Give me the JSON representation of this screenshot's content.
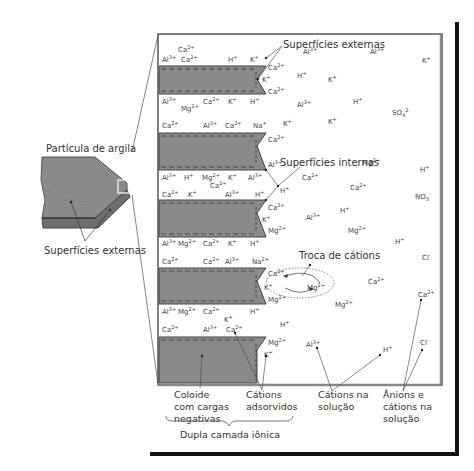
{
  "labels": {
    "particle_title": "Partícula de argila",
    "particle_external": "Superfícies externas",
    "external_surfaces": "Superfícies externas",
    "internal_surfaces": "Superfícies internas",
    "cation_exchange": "Troca de cátions",
    "colloid": [
      "Coloide",
      "com cargas",
      "negativas"
    ],
    "adsorbed_cations": [
      "Cátions",
      "adsorvidos"
    ],
    "solution_cations": [
      "Cátions na",
      "solução"
    ],
    "anions_cations": [
      "Ânions e",
      "cátions na",
      "solução"
    ],
    "double_layer": "Dupla camada iônica"
  },
  "colors": {
    "clay": "#8a8a8a",
    "clay_dark": "#5a5a5a",
    "frame": "#111111",
    "box_border": "#555555",
    "text": "#333333"
  },
  "ions": [
    {
      "x": 178,
      "y": 52,
      "b": "Ca",
      "s": "2+"
    },
    {
      "x": 162,
      "y": 62,
      "b": "Al",
      "s": "3+"
    },
    {
      "x": 181,
      "y": 62,
      "b": "Ca",
      "s": "2+"
    },
    {
      "x": 228,
      "y": 62,
      "b": "H",
      "s": "+"
    },
    {
      "x": 250,
      "y": 62,
      "b": "K",
      "s": "+"
    },
    {
      "x": 268,
      "y": 70,
      "b": "Ca",
      "s": "2+"
    },
    {
      "x": 262,
      "y": 82,
      "b": "K",
      "s": "+"
    },
    {
      "x": 268,
      "y": 94,
      "b": "Ca",
      "s": "2+"
    },
    {
      "x": 303,
      "y": 54,
      "b": "Al",
      "s": "3+"
    },
    {
      "x": 370,
      "y": 54,
      "b": "Al",
      "s": "3+"
    },
    {
      "x": 422,
      "y": 63,
      "b": "K",
      "s": "+"
    },
    {
      "x": 297,
      "y": 78,
      "b": "H",
      "s": "+"
    },
    {
      "x": 328,
      "y": 82,
      "b": "K",
      "s": "+"
    },
    {
      "x": 162,
      "y": 104,
      "b": "Al",
      "s": "3+"
    },
    {
      "x": 181,
      "y": 111,
      "b": "Mg",
      "s": "2+"
    },
    {
      "x": 203,
      "y": 104,
      "b": "Ca",
      "s": "2+"
    },
    {
      "x": 228,
      "y": 104,
      "b": "K",
      "s": "+"
    },
    {
      "x": 250,
      "y": 104,
      "b": "H",
      "s": "+"
    },
    {
      "x": 297,
      "y": 107,
      "b": "Al",
      "s": "3+"
    },
    {
      "x": 353,
      "y": 104,
      "b": "H",
      "s": "+"
    },
    {
      "x": 392,
      "y": 115,
      "b": "SO",
      "sub": "4",
      "s": "2-"
    },
    {
      "x": 328,
      "y": 124,
      "b": "K",
      "s": "+"
    },
    {
      "x": 162,
      "y": 128,
      "b": "Ca",
      "s": "2+"
    },
    {
      "x": 203,
      "y": 128,
      "b": "Al",
      "s": "3+"
    },
    {
      "x": 225,
      "y": 128,
      "b": "Ca",
      "s": "2+"
    },
    {
      "x": 253,
      "y": 128,
      "b": "Na",
      "s": "+"
    },
    {
      "x": 283,
      "y": 126,
      "b": "K",
      "s": "+"
    },
    {
      "x": 268,
      "y": 142,
      "b": "Ca",
      "s": "2+"
    },
    {
      "x": 268,
      "y": 167,
      "b": "Al",
      "s": "3+"
    },
    {
      "x": 302,
      "y": 180,
      "b": "Ca",
      "s": "2+"
    },
    {
      "x": 362,
      "y": 165,
      "b": "Mg",
      "s": "2+"
    },
    {
      "x": 420,
      "y": 172,
      "b": "H",
      "s": "+"
    },
    {
      "x": 162,
      "y": 180,
      "b": "Al",
      "s": "3+"
    },
    {
      "x": 184,
      "y": 180,
      "b": "H",
      "s": "+"
    },
    {
      "x": 202,
      "y": 180,
      "b": "Mg",
      "s": "2+"
    },
    {
      "x": 228,
      "y": 180,
      "b": "K",
      "s": "+"
    },
    {
      "x": 248,
      "y": 180,
      "b": "Al",
      "s": "3+"
    },
    {
      "x": 210,
      "y": 188,
      "b": "Ca",
      "s": "2+"
    },
    {
      "x": 350,
      "y": 190,
      "b": "Ca",
      "s": "2+"
    },
    {
      "x": 415,
      "y": 199,
      "b": "NO",
      "sub": "3",
      "s": "-"
    },
    {
      "x": 162,
      "y": 197,
      "b": "Ca",
      "s": "2+"
    },
    {
      "x": 188,
      "y": 197,
      "b": "K",
      "s": "+"
    },
    {
      "x": 225,
      "y": 197,
      "b": "Al",
      "s": "3+"
    },
    {
      "x": 255,
      "y": 197,
      "b": "H",
      "s": "+"
    },
    {
      "x": 280,
      "y": 193,
      "b": "H",
      "s": "+"
    },
    {
      "x": 268,
      "y": 210,
      "b": "Ca",
      "s": "2+"
    },
    {
      "x": 262,
      "y": 222,
      "b": "K",
      "s": "+"
    },
    {
      "x": 268,
      "y": 233,
      "b": "Mg",
      "s": "2+"
    },
    {
      "x": 306,
      "y": 220,
      "b": "Al",
      "s": "3+"
    },
    {
      "x": 340,
      "y": 213,
      "b": "H",
      "s": "+"
    },
    {
      "x": 348,
      "y": 233,
      "b": "Mg",
      "s": "2+"
    },
    {
      "x": 162,
      "y": 246,
      "b": "Al",
      "s": "3+"
    },
    {
      "x": 178,
      "y": 246,
      "b": "Mg",
      "s": "2+"
    },
    {
      "x": 203,
      "y": 246,
      "b": "Ca",
      "s": "2+"
    },
    {
      "x": 228,
      "y": 246,
      "b": "K",
      "s": "+"
    },
    {
      "x": 250,
      "y": 246,
      "b": "H",
      "s": "+"
    },
    {
      "x": 395,
      "y": 244,
      "b": "H",
      "s": "+"
    },
    {
      "x": 162,
      "y": 264,
      "b": "Ca",
      "s": "2+"
    },
    {
      "x": 203,
      "y": 264,
      "b": "Ca",
      "s": "2+"
    },
    {
      "x": 225,
      "y": 264,
      "b": "Al",
      "s": "3+"
    },
    {
      "x": 252,
      "y": 264,
      "b": "Na",
      "s": "2+"
    },
    {
      "x": 422,
      "y": 260,
      "b": "Cl",
      "s": "-"
    },
    {
      "x": 268,
      "y": 276,
      "b": "Ca",
      "s": "2+"
    },
    {
      "x": 264,
      "y": 290,
      "b": "K",
      "s": "+"
    },
    {
      "x": 307,
      "y": 290,
      "b": "Mg",
      "s": "2+"
    },
    {
      "x": 368,
      "y": 284,
      "b": "Ca",
      "s": "2+"
    },
    {
      "x": 268,
      "y": 302,
      "b": "Mg",
      "s": "2+"
    },
    {
      "x": 335,
      "y": 307,
      "b": "Mg",
      "s": "2+"
    },
    {
      "x": 418,
      "y": 297,
      "b": "Ca",
      "s": "2+"
    },
    {
      "x": 162,
      "y": 314,
      "b": "Al",
      "s": "3+"
    },
    {
      "x": 178,
      "y": 314,
      "b": "Mg",
      "s": "2+"
    },
    {
      "x": 203,
      "y": 314,
      "b": "Ca",
      "s": "2+"
    },
    {
      "x": 250,
      "y": 314,
      "b": "H",
      "s": "+"
    },
    {
      "x": 224,
      "y": 322,
      "b": "K",
      "s": "+"
    },
    {
      "x": 162,
      "y": 332,
      "b": "Ca",
      "s": "2+"
    },
    {
      "x": 203,
      "y": 332,
      "b": "Al",
      "s": "3+"
    },
    {
      "x": 226,
      "y": 332,
      "b": "Ca",
      "s": "2+"
    },
    {
      "x": 280,
      "y": 327,
      "b": "H",
      "s": "+"
    },
    {
      "x": 268,
      "y": 345,
      "b": "Mg",
      "s": "2+"
    },
    {
      "x": 264,
      "y": 357,
      "b": "K",
      "s": "+"
    },
    {
      "x": 306,
      "y": 347,
      "b": "Al",
      "s": "3+"
    },
    {
      "x": 383,
      "y": 352,
      "b": "H",
      "s": "+"
    },
    {
      "x": 420,
      "y": 345,
      "b": "Cl",
      "s": "-"
    }
  ]
}
